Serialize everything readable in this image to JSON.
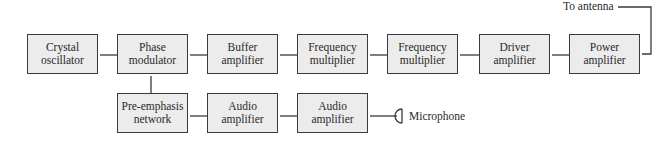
{
  "diagram": {
    "type": "block-diagram",
    "blocks": [
      {
        "id": "crystal",
        "line1": "Crystal",
        "line2": "oscillator"
      },
      {
        "id": "phase_mod",
        "line1": "Phase",
        "line2": "modulator"
      },
      {
        "id": "buffer",
        "line1": "Buffer",
        "line2": "amplifier"
      },
      {
        "id": "freq_mult_1",
        "line1": "Frequency",
        "line2": "multiplier"
      },
      {
        "id": "freq_mult_2",
        "line1": "Frequency",
        "line2": "multiplier"
      },
      {
        "id": "driver",
        "line1": "Driver",
        "line2": "amplifier"
      },
      {
        "id": "power",
        "line1": "Power",
        "line2": "amplifier"
      },
      {
        "id": "pre_emphasis",
        "line1": "Pre-emphasis",
        "line2": "network"
      },
      {
        "id": "audio_1",
        "line1": "Audio",
        "line2": "amplifier"
      },
      {
        "id": "audio_2",
        "line1": "Audio",
        "line2": "amplifier"
      }
    ],
    "labels": {
      "antenna": "To antenna",
      "microphone": "Microphone"
    },
    "connections": [
      [
        "crystal",
        "phase_mod"
      ],
      [
        "phase_mod",
        "buffer"
      ],
      [
        "buffer",
        "freq_mult_1"
      ],
      [
        "freq_mult_1",
        "freq_mult_2"
      ],
      [
        "freq_mult_2",
        "driver"
      ],
      [
        "driver",
        "power"
      ],
      [
        "power",
        "antenna"
      ],
      [
        "microphone",
        "audio_2"
      ],
      [
        "audio_2",
        "audio_1"
      ],
      [
        "audio_1",
        "pre_emphasis"
      ],
      [
        "pre_emphasis",
        "phase_mod"
      ]
    ],
    "colors": {
      "box_fill": "#ececec",
      "stroke": "#3a3a3a",
      "text": "#2a2a2a"
    }
  }
}
